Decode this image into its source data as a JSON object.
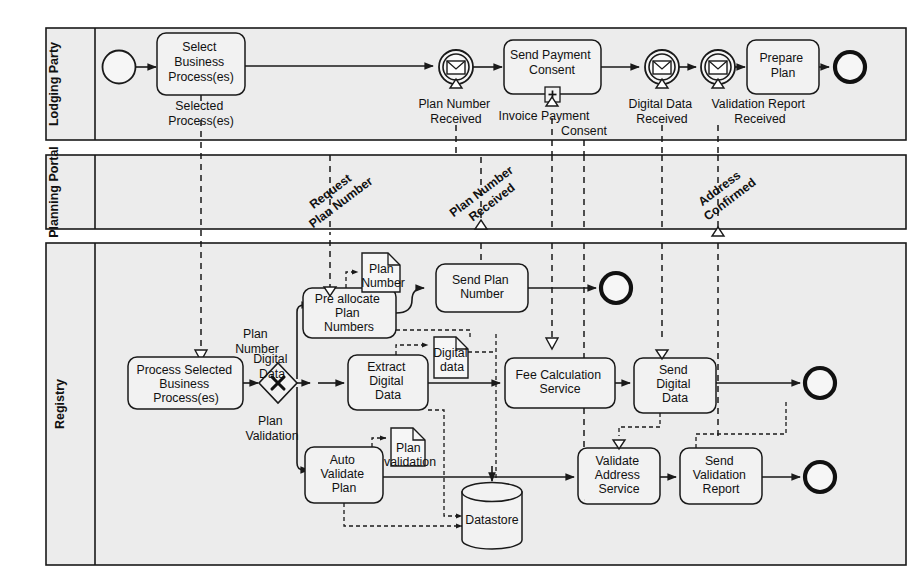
{
  "diagram": {
    "type": "bpmn-collaboration",
    "lanes": [
      {
        "id": "lodging",
        "label": "Lodging Party"
      },
      {
        "id": "portal",
        "label": "Planning Portal"
      },
      {
        "id": "registry",
        "label": "Registry"
      }
    ],
    "lodging_party": {
      "start_event": "start",
      "tasks": [
        {
          "id": "select-business-process",
          "lines": [
            "Select",
            "Business",
            "Process(es)"
          ]
        },
        {
          "id": "send-payment-consent",
          "lines": [
            "Send Payment",
            "Consent"
          ],
          "marker": "sub-process"
        },
        {
          "id": "prepare-plan",
          "lines": [
            "Prepare",
            "Plan"
          ]
        }
      ],
      "message_events": [
        {
          "id": "plan-number-received",
          "lines": [
            "Plan Number",
            "Received"
          ]
        },
        {
          "id": "digital-data-received",
          "lines": [
            "Digital Data",
            "Received"
          ]
        },
        {
          "id": "validation-report-received",
          "lines": [
            "Validation Report",
            "Received"
          ]
        }
      ],
      "flow_labels": [
        {
          "id": "selected-processes",
          "lines": [
            "Selected",
            "Process(es)"
          ]
        },
        {
          "id": "invoice-payment",
          "lines": [
            "Invoice Payment"
          ]
        },
        {
          "id": "consent",
          "lines": [
            "Consent"
          ]
        }
      ],
      "end_event": "end"
    },
    "planning_portal": {
      "message_labels": [
        {
          "id": "request-plan-number",
          "lines": [
            "Request",
            "Plan Number"
          ]
        },
        {
          "id": "plan-number-received-portal",
          "lines": [
            "Plan Number",
            "Received"
          ]
        },
        {
          "id": "address-confirmed",
          "lines": [
            "Address",
            "Confirmed"
          ]
        }
      ]
    },
    "registry": {
      "tasks": [
        {
          "id": "process-selected-business-processes",
          "lines": [
            "Process Selected",
            "Business",
            "Process(es)"
          ]
        },
        {
          "id": "pre-allocate-plan-numbers",
          "lines": [
            "Pre allocate",
            "Plan",
            "Numbers"
          ]
        },
        {
          "id": "send-plan-number",
          "lines": [
            "Send Plan",
            "Number"
          ]
        },
        {
          "id": "extract-digital-data",
          "lines": [
            "Extract",
            "Digital",
            "Data"
          ]
        },
        {
          "id": "fee-calculation-service",
          "lines": [
            "Fee Calculation",
            "Service"
          ]
        },
        {
          "id": "send-digital-data",
          "lines": [
            "Send",
            "Digital",
            "Data"
          ]
        },
        {
          "id": "auto-validate-plan",
          "lines": [
            "Auto",
            "Validate",
            "Plan"
          ]
        },
        {
          "id": "validate-address-service",
          "lines": [
            "Validate",
            "Address",
            "Service"
          ]
        },
        {
          "id": "send-validation-report",
          "lines": [
            "Send",
            "Validation",
            "Report"
          ]
        }
      ],
      "gateway": {
        "id": "split-gateway",
        "kind": "exclusive",
        "symbol": "X"
      },
      "gateway_branch_labels": [
        {
          "id": "branch-plan-number",
          "lines": [
            "Plan",
            "Number"
          ]
        },
        {
          "id": "branch-digital-data",
          "lines": [
            "Digital",
            "Data"
          ]
        },
        {
          "id": "branch-plan-validation",
          "lines": [
            "Plan",
            "Validation"
          ]
        }
      ],
      "data_objects": [
        {
          "id": "data-plan-number",
          "lines": [
            "Plan",
            "Number"
          ]
        },
        {
          "id": "data-digital-data",
          "lines": [
            "Digital",
            "data"
          ]
        },
        {
          "id": "data-plan-validation",
          "lines": [
            "Plan",
            "validation"
          ]
        }
      ],
      "data_store": {
        "id": "datastore",
        "label": "Datastore"
      },
      "end_events": 3
    },
    "colors": {
      "lane_fill": "#ececec",
      "shape_fill": "#f2f2f2",
      "stroke": "#1a1a1a",
      "page": "#ffffff"
    }
  }
}
